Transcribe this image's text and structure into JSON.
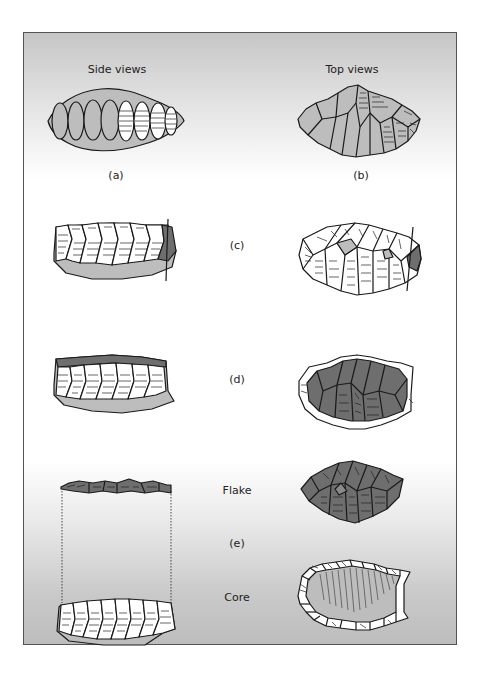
{
  "figure": {
    "column_headers": {
      "side": "Side views",
      "top": "Top views"
    },
    "panels": [
      {
        "id": "a",
        "label": "(a)",
        "view": "side",
        "description": "Preform with first row of flake scars along edge"
      },
      {
        "id": "b",
        "label": "(b)",
        "view": "top",
        "description": "Top view of preform with flake scars"
      },
      {
        "id": "c",
        "label": "(c)",
        "view": "both",
        "description": "Platform edge prepared with small removals"
      },
      {
        "id": "d",
        "label": "(d)",
        "view": "both",
        "description": "Top surface prepared, dark area is the flake to be removed"
      },
      {
        "id": "e",
        "label": "(e)",
        "view": "both",
        "description": "Flake removed from core",
        "sub_labels": {
          "flake": "Flake",
          "core": "Core"
        }
      }
    ],
    "colors": {
      "light_fill": "#bdbdbd",
      "dark_fill": "#6e6e6e",
      "outline": "#1a1a1a",
      "frame_border": "#555555",
      "background_top": "#c6c6c6",
      "background_mid": "#ffffff",
      "background_bottom": "#bdbdbd"
    }
  }
}
